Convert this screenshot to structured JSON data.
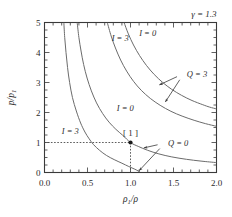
{
  "figure": {
    "background": "#ffffff",
    "annotation_top_right": "γ = 1.3",
    "point_label": "[ 1 ]",
    "curve_labels": {
      "i3_left": "I = 3",
      "i0_left": "I = 0",
      "i3_right": "I = 3",
      "i0_right": "I = 0",
      "q3": "Q = 3",
      "q0": "Q = 0"
    },
    "colors": {
      "curve": "#6b6b6b",
      "axis": "#3a3a3a",
      "text": "#2b2b2b",
      "dotted": "#4a4a4a"
    }
  },
  "chart_data": {
    "type": "line",
    "title": "",
    "subtitle": "",
    "annotation": "γ = 1.3",
    "xlabel": "ρ₁/ρ",
    "ylabel": "p/p₁",
    "xlim": [
      0.0,
      2.0
    ],
    "ylim": [
      0,
      5
    ],
    "xticks": [
      "0.0",
      "0.5",
      "1.0",
      "1.5",
      "2.0"
    ],
    "xtick_values": [
      0.0,
      0.5,
      1.0,
      1.5,
      2.0
    ],
    "yticks": [
      "0",
      "1",
      "2",
      "3",
      "4",
      "5"
    ],
    "ytick_values": [
      0,
      1,
      2,
      3,
      4,
      5
    ],
    "minor_ticks": true,
    "grid": false,
    "legend": "inline-curve-labels",
    "reference_point": {
      "label": "[ 1 ]",
      "x": 1.0,
      "y": 1.0
    },
    "dotted_guides": [
      {
        "from": [
          0.0,
          1.0
        ],
        "to": [
          1.0,
          1.0
        ]
      },
      {
        "from": [
          1.0,
          1.0
        ],
        "to": [
          1.0,
          0.0
        ]
      }
    ],
    "series": [
      {
        "name": "Q = 0, I = 3",
        "label": "I = 3",
        "label_at": [
          0.3,
          1.3
        ],
        "group": "Q=0",
        "points": [
          [
            0.225,
            5.0
          ],
          [
            0.235,
            4.5
          ],
          [
            0.25,
            4.0
          ],
          [
            0.268,
            3.5
          ],
          [
            0.292,
            3.0
          ],
          [
            0.325,
            2.5
          ],
          [
            0.37,
            2.05
          ],
          [
            0.42,
            1.65
          ],
          [
            0.47,
            1.35
          ],
          [
            0.52,
            1.12
          ],
          [
            0.57,
            0.93
          ],
          [
            0.64,
            0.74
          ],
          [
            0.72,
            0.57
          ],
          [
            0.81,
            0.43
          ],
          [
            0.9,
            0.31
          ],
          [
            0.98,
            0.2
          ],
          [
            1.05,
            0.11
          ],
          [
            1.09,
            0.05
          ],
          [
            1.11,
            0.01
          ]
        ]
      },
      {
        "name": "Q = 0, I = 0",
        "label": "I = 0",
        "label_at": [
          0.94,
          2.05
        ],
        "group": "Q=0",
        "points": [
          [
            0.38,
            5.0
          ],
          [
            0.4,
            4.5
          ],
          [
            0.425,
            4.05
          ],
          [
            0.455,
            3.6
          ],
          [
            0.495,
            3.15
          ],
          [
            0.545,
            2.72
          ],
          [
            0.605,
            2.32
          ],
          [
            0.675,
            1.97
          ],
          [
            0.75,
            1.68
          ],
          [
            0.83,
            1.44
          ],
          [
            0.91,
            1.24
          ],
          [
            1.0,
            1.0
          ],
          [
            1.09,
            0.87
          ],
          [
            1.2,
            0.74
          ],
          [
            1.33,
            0.62
          ],
          [
            1.48,
            0.52
          ],
          [
            1.65,
            0.44
          ],
          [
            1.82,
            0.38
          ],
          [
            2.0,
            0.33
          ]
        ]
      },
      {
        "name": "Q = 3, I = 3",
        "label": "I = 3",
        "label_at": [
          0.88,
          4.4
        ],
        "group": "Q=3",
        "points": [
          [
            0.73,
            5.0
          ],
          [
            0.775,
            4.55
          ],
          [
            0.825,
            4.15
          ],
          [
            0.885,
            3.75
          ],
          [
            0.955,
            3.38
          ],
          [
            1.035,
            3.04
          ],
          [
            1.125,
            2.74
          ],
          [
            1.23,
            2.47
          ],
          [
            1.345,
            2.24
          ],
          [
            1.47,
            2.04
          ],
          [
            1.6,
            1.88
          ],
          [
            1.74,
            1.74
          ],
          [
            1.87,
            1.63
          ],
          [
            2.0,
            1.54
          ]
        ]
      },
      {
        "name": "Q = 3, I = 0",
        "label": "I = 0",
        "label_at": [
          1.2,
          4.55
        ],
        "group": "Q=3",
        "points": [
          [
            0.925,
            5.0
          ],
          [
            0.975,
            4.62
          ],
          [
            1.035,
            4.25
          ],
          [
            1.105,
            3.9
          ],
          [
            1.185,
            3.57
          ],
          [
            1.275,
            3.27
          ],
          [
            1.375,
            3.0
          ],
          [
            1.48,
            2.77
          ],
          [
            1.595,
            2.57
          ],
          [
            1.715,
            2.4
          ],
          [
            1.84,
            2.26
          ],
          [
            1.92,
            2.18
          ],
          [
            2.0,
            2.12
          ]
        ]
      }
    ],
    "arrow_annotations": [
      {
        "label": "Q = 3",
        "label_at": [
          1.62,
          3.3
        ],
        "arrows": [
          {
            "to": [
              1.335,
              2.92
            ]
          },
          {
            "to": [
              1.405,
              2.35
            ]
          }
        ]
      },
      {
        "label": "Q = 0",
        "label_at": [
          1.4,
          0.98
        ],
        "arrows": [
          {
            "to": [
              1.155,
              0.82
            ]
          },
          {
            "to": [
              1.1,
              0.06
            ]
          }
        ]
      }
    ]
  }
}
